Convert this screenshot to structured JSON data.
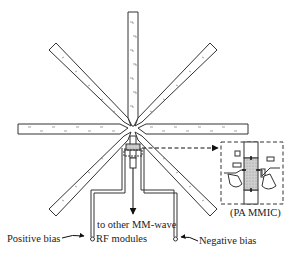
{
  "diagram": {
    "type": "antenna-array-schematic",
    "arms": [
      {
        "name": "top",
        "angle_deg": 90
      },
      {
        "name": "upper-right",
        "angle_deg": 45
      },
      {
        "name": "right",
        "angle_deg": 0
      },
      {
        "name": "lower-right",
        "angle_deg": -45
      },
      {
        "name": "lower-left",
        "angle_deg": -135
      },
      {
        "name": "left",
        "angle_deg": 180
      },
      {
        "name": "upper-left",
        "angle_deg": 135
      },
      {
        "name": "bottom-feed",
        "angle_deg": -90
      }
    ],
    "labels": {
      "inset": "(PA MMIC)",
      "output_line1": "to other MM-wave",
      "output_line2": "RF modules",
      "positive_bias": "Positive bias",
      "negative_bias": "Negative bias"
    },
    "colors": {
      "stroke": "#333333",
      "mmic_fill": "#c8c8c8"
    }
  }
}
